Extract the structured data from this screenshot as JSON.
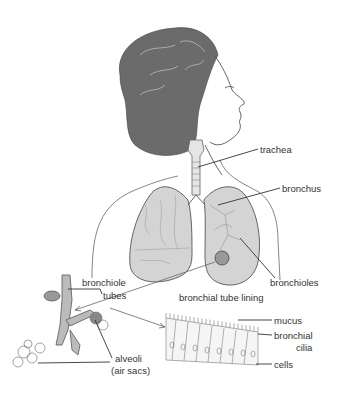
{
  "diagram": {
    "labels": {
      "trachea": "trachea",
      "bronchus": "bronchus",
      "bronchioles": "bronchioles",
      "bronchiole_tubes_1": "bronchiole",
      "bronchiole_tubes_2": "tubes",
      "alveoli_1": "alveoli",
      "alveoli_2": "(air sacs)",
      "lining_title": "bronchial tube lining",
      "mucus": "mucus",
      "cilia_1": "bronchial",
      "cilia_2": "cilia",
      "cells": "cells"
    },
    "colors": {
      "ink": "#333333",
      "hair": "#6b6b6b",
      "lung_fill": "#d4d4d4",
      "background": "#ffffff"
    }
  }
}
